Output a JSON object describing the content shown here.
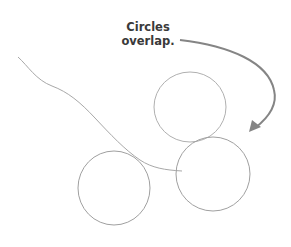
{
  "annotation": {
    "line1": "Circles",
    "line2": "overlap."
  },
  "colors": {
    "sketch": "#9a9a9a",
    "arrow": "#808080",
    "text": "#3a3a3a"
  }
}
